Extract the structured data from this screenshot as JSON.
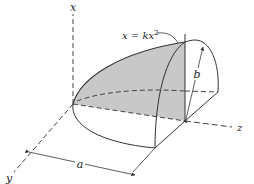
{
  "figure": {
    "type": "3d-geometry-diagram",
    "colors": {
      "line": "#333333",
      "shade": "#c8c8c8",
      "background": "#ffffff"
    }
  },
  "labels": {
    "x_axis": "x",
    "y_axis": "y",
    "z_axis": "z",
    "equation_lhs": "x = kx",
    "equation_exp": "2",
    "dim_a": "a",
    "dim_b": "b"
  }
}
